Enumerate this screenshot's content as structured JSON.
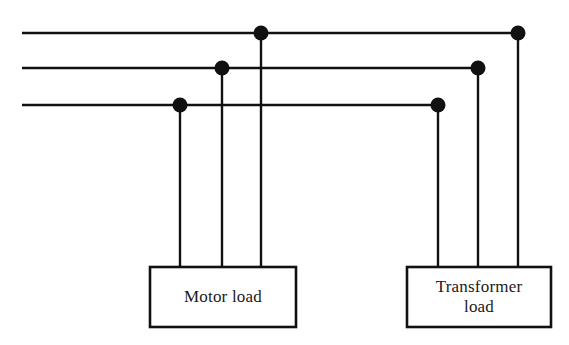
{
  "figure": {
    "type": "electrical-one-line-diagram",
    "background_color": "#ffffff",
    "line_color": "#111111"
  },
  "canvas": {
    "width": 569,
    "height": 345
  },
  "bus_lines": [
    {
      "name": "phase-line-top",
      "y": 33,
      "x_start": 22,
      "x_end": 518,
      "stroke_width": 2.6
    },
    {
      "name": "phase-line-middle",
      "y": 68,
      "x_start": 22,
      "x_end": 478,
      "stroke_width": 2.6
    },
    {
      "name": "phase-line-bottom",
      "y": 105,
      "x_start": 22,
      "x_end": 438,
      "stroke_width": 2.6
    }
  ],
  "junction_dots": [
    {
      "name": "junction-top-motor",
      "x": 261,
      "y": 33,
      "r": 7.5
    },
    {
      "name": "junction-top-transformer",
      "x": 518,
      "y": 33,
      "r": 7.5
    },
    {
      "name": "junction-middle-motor",
      "x": 222,
      "y": 68,
      "r": 7.5
    },
    {
      "name": "junction-middle-transformer",
      "x": 478,
      "y": 68,
      "r": 7.5
    },
    {
      "name": "junction-bottom-motor",
      "x": 180,
      "y": 105,
      "r": 7.5
    },
    {
      "name": "junction-bottom-transformer",
      "x": 438,
      "y": 105,
      "r": 7.5
    }
  ],
  "drop_lines": [
    {
      "name": "drop-motor-phase-c",
      "x": 180,
      "y_start": 105,
      "y_end": 267,
      "stroke_width": 2.4
    },
    {
      "name": "drop-motor-phase-b",
      "x": 222,
      "y_start": 68,
      "y_end": 267,
      "stroke_width": 2.4
    },
    {
      "name": "drop-motor-phase-a",
      "x": 261,
      "y_start": 33,
      "y_end": 267,
      "stroke_width": 2.4
    },
    {
      "name": "drop-transformer-phase-c",
      "x": 438,
      "y_start": 105,
      "y_end": 267,
      "stroke_width": 2.4
    },
    {
      "name": "drop-transformer-phase-b",
      "x": 478,
      "y_start": 68,
      "y_end": 267,
      "stroke_width": 2.4
    },
    {
      "name": "drop-transformer-phase-a",
      "x": 518,
      "y_start": 33,
      "y_end": 267,
      "stroke_width": 2.4
    }
  ],
  "loads": [
    {
      "name": "motor-load",
      "label": "Motor load",
      "x": 150,
      "y": 267,
      "width": 146,
      "height": 60
    },
    {
      "name": "transformer-load",
      "label": "Transformer\nload",
      "x": 407,
      "y": 267,
      "width": 144,
      "height": 60
    }
  ]
}
